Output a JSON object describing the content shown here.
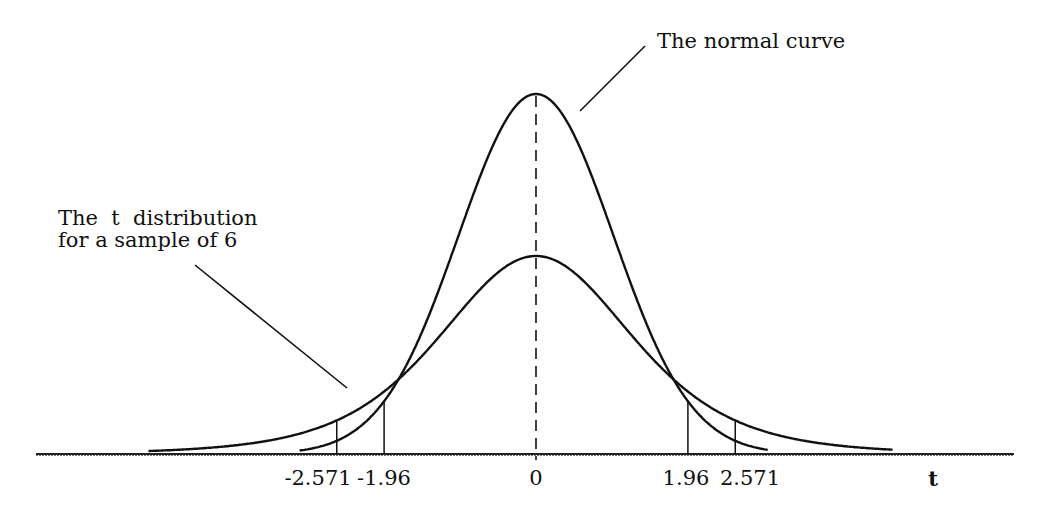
{
  "chart_data": {
    "type": "line",
    "title": "",
    "xlabel": "t",
    "ylabel": "",
    "grid": false,
    "legend": "none (callout labels)",
    "x_range": [
      -6.5,
      6.2
    ],
    "tick_labels": [
      "-2.571",
      "-1.96",
      "0",
      "1.96",
      "2.571"
    ],
    "tick_values": [
      -2.571,
      -1.96,
      0,
      1.96,
      2.571
    ],
    "series": [
      {
        "name": "The normal curve",
        "description": "Tall narrow bell curve peaking at t=0",
        "peak_x": 0,
        "relative_peak_height": 1.0,
        "drawn_x_range": [
          -3.05,
          3.0
        ]
      },
      {
        "name": "The t distribution for a sample of 6",
        "description": "Lower, wider bell curve with heavier tails, peaking at t=0",
        "peak_x": 0,
        "relative_peak_height": 0.55,
        "drawn_x_range": [
          -5.0,
          4.6
        ]
      }
    ],
    "annotations": [
      {
        "text": "The normal curve",
        "points_to": "normal curve right shoulder"
      },
      {
        "text": "The t distribution\nfor a sample of 6",
        "points_to": "t distribution left tail"
      },
      {
        "type": "dashed-vertical-line",
        "x": 0
      },
      {
        "type": "vertical-line",
        "x": -2.571,
        "meaning": "t critical value (df=5)"
      },
      {
        "type": "vertical-line",
        "x": -1.96,
        "meaning": "normal critical value"
      },
      {
        "type": "vertical-line",
        "x": 1.96,
        "meaning": "normal critical value"
      },
      {
        "type": "vertical-line",
        "x": 2.571,
        "meaning": "t critical value (df=5)"
      }
    ]
  },
  "labels": {
    "normal_curve": "The normal curve",
    "t_dist_line1": "The  t  distribution",
    "t_dist_line2": "for a sample of 6",
    "axis_t": "t"
  },
  "ticks": {
    "neg_2571": "-2.571",
    "neg_196": "-1.96",
    "zero": "0",
    "pos_196": "1.96",
    "pos_2571": "2.571"
  },
  "colors": {
    "ink": "#111111",
    "background": "#ffffff"
  }
}
